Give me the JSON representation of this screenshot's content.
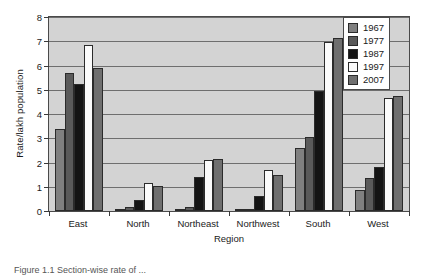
{
  "chart_data": {
    "type": "bar",
    "title": "",
    "xlabel": "Region",
    "ylabel": "Rate/lakh population",
    "categories": [
      "East",
      "North",
      "Northeast",
      "Northwest",
      "South",
      "West"
    ],
    "ylim": [
      0,
      8
    ],
    "yticks": [
      "0",
      "1",
      "2",
      "3",
      "4",
      "5",
      "6",
      "7",
      "8"
    ],
    "grid": true,
    "legend_position": "top-right",
    "series": [
      {
        "name": "1967",
        "color": "#808080",
        "values": [
          3.4,
          0.1,
          0.1,
          0.05,
          2.6,
          0.85
        ]
      },
      {
        "name": "1977",
        "color": "#5a5a5a",
        "values": [
          5.7,
          0.15,
          0.15,
          0.1,
          3.05,
          1.35
        ]
      },
      {
        "name": "1987",
        "color": "#141414",
        "values": [
          5.25,
          0.45,
          1.4,
          0.6,
          4.95,
          1.8
        ]
      },
      {
        "name": "1997",
        "color": "#fbfbfb",
        "values": [
          6.85,
          1.15,
          2.1,
          1.7,
          6.95,
          4.65
        ]
      },
      {
        "name": "2007",
        "color": "#6f6f6f",
        "values": [
          5.9,
          1.05,
          2.15,
          1.5,
          7.15,
          4.75
        ]
      }
    ]
  },
  "caption": {
    "text": "Figure 1.1 Section-wise rate of ..."
  }
}
